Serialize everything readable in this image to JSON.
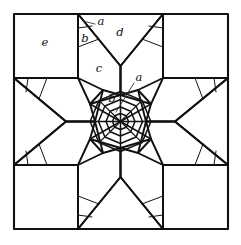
{
  "figure": {
    "type": "geometric-tiling-diagram",
    "background_color": "#ffffff",
    "line_color": "#111111",
    "canvas": {
      "width": 241,
      "height": 245
    },
    "frame": {
      "x": 14,
      "y": 14,
      "width": 214,
      "height": 215
    },
    "center": {
      "x": 120.5,
      "y": 121.5
    }
  },
  "labels": [
    {
      "id": "a-top",
      "text": "a",
      "x": 101,
      "y": 22,
      "leader": {
        "x1": 95,
        "y1": 24,
        "x2": 83,
        "y2": 21
      }
    },
    {
      "id": "b-top",
      "text": "b",
      "x": 85,
      "y": 39,
      "leader": null
    },
    {
      "id": "d-top",
      "text": "d",
      "x": 120,
      "y": 33,
      "leader": null
    },
    {
      "id": "c-mid",
      "text": "c",
      "x": 99,
      "y": 69,
      "leader": null
    },
    {
      "id": "a-center",
      "text": "a",
      "x": 139,
      "y": 78,
      "leader": {
        "x1": 134,
        "y1": 83,
        "x2": 116,
        "y2": 112
      }
    },
    {
      "id": "b-center",
      "text": "b",
      "x": 112,
      "y": 99,
      "leader": null
    },
    {
      "id": "e-corner",
      "text": "e",
      "x": 45,
      "y": 43,
      "leader": null
    }
  ],
  "regions": {
    "a": "small corner triangle tile",
    "b": "kite tile adjacent to corner triangle",
    "c": "large hexagonal tile between star points",
    "d": "star point tile (outer ray)",
    "e": "corner square tile"
  },
  "chart_data": {
    "type": "diagram",
    "elements": [
      "outer square frame",
      "four corner squares",
      "eight star points",
      "central octagonal rosette",
      "concentric octagon rings",
      "radial spokes"
    ],
    "symmetry": "4-fold (D4) with 8-fold central rosette"
  }
}
